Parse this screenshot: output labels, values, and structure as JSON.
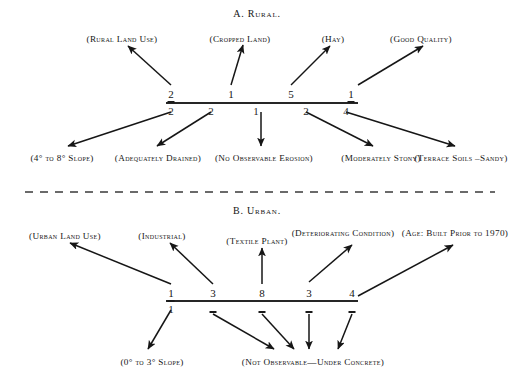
{
  "figure": {
    "sections": [
      {
        "id": "rural",
        "title": "A.  Rural.",
        "title_x": 257,
        "title_y": 8,
        "axis": {
          "x1": 166,
          "x2": 358,
          "y": 103
        },
        "codes_above": [
          {
            "value": "2",
            "x": 171,
            "y": 88,
            "underline": true
          },
          {
            "value": "1",
            "x": 231,
            "y": 88,
            "underline": false
          },
          {
            "value": "5",
            "x": 291,
            "y": 88,
            "underline": false
          },
          {
            "value": "1",
            "x": 351,
            "y": 88,
            "underline": true
          }
        ],
        "codes_below": [
          {
            "value": "2",
            "x": 171,
            "y": 105
          },
          {
            "value": "2",
            "x": 211,
            "y": 105
          },
          {
            "value": "1",
            "x": 256,
            "y": 105
          },
          {
            "value": "2",
            "x": 306,
            "y": 105
          },
          {
            "value": "4",
            "x": 346,
            "y": 105
          }
        ],
        "labels_above": [
          {
            "text": "(Rural Land Use)",
            "x": 122,
            "y": 34,
            "lines": 1
          },
          {
            "text": "(Cropped Land)",
            "x": 240,
            "y": 34,
            "lines": 1
          },
          {
            "text": "(Hay)",
            "x": 333,
            "y": 34,
            "lines": 1
          },
          {
            "text": "(Good Quality)",
            "x": 421,
            "y": 34,
            "lines": 1
          }
        ],
        "labels_below": [
          {
            "text": "(4° to 8° Slope)",
            "x": 62,
            "y": 153,
            "lines": 1
          },
          {
            "text": "(Adequately Drained)",
            "x": 158,
            "y": 153,
            "lines": 2
          },
          {
            "text": "(No Observable Erosion)",
            "x": 264,
            "y": 153,
            "lines": 1
          },
          {
            "text": "(Moderately Stony)",
            "x": 381,
            "y": 153,
            "lines": 2
          },
          {
            "text": "(Terrace Soils –Sandy)",
            "x": 461,
            "y": 153,
            "lines": 2
          }
        ],
        "arrows_up": [
          {
            "from_x": 171,
            "from_y": 85,
            "to_x": 128,
            "to_y": 46
          },
          {
            "from_x": 231,
            "from_y": 85,
            "to_x": 243,
            "to_y": 45
          },
          {
            "from_x": 291,
            "from_y": 85,
            "to_x": 330,
            "to_y": 46
          },
          {
            "from_x": 358,
            "from_y": 85,
            "to_x": 423,
            "to_y": 46
          }
        ],
        "arrows_down": [
          {
            "from_x": 171,
            "from_y": 112,
            "to_x": 68,
            "to_y": 146
          },
          {
            "from_x": 211,
            "from_y": 112,
            "to_x": 157,
            "to_y": 146
          },
          {
            "from_x": 261,
            "from_y": 112,
            "to_x": 261,
            "to_y": 146
          },
          {
            "from_x": 306,
            "from_y": 112,
            "to_x": 373,
            "to_y": 146
          },
          {
            "from_x": 346,
            "from_y": 112,
            "to_x": 455,
            "to_y": 146
          }
        ]
      },
      {
        "id": "urban",
        "title": "B.  Urban.",
        "title_x": 257,
        "title_y": 205,
        "axis": {
          "x1": 166,
          "x2": 358,
          "y": 301
        },
        "codes_above": [
          {
            "value": "1",
            "x": 171,
            "y": 287,
            "underline": true
          },
          {
            "value": "3",
            "x": 213,
            "y": 287,
            "underline": false
          },
          {
            "value": "8",
            "x": 262,
            "y": 287,
            "underline": false
          },
          {
            "value": "3",
            "x": 309,
            "y": 287,
            "underline": false
          },
          {
            "value": "4",
            "x": 352,
            "y": 287,
            "underline": false
          }
        ],
        "codes_below": [
          {
            "value": "1",
            "x": 171,
            "y": 303
          }
        ],
        "dashes_below": [
          {
            "x": 213,
            "y": 311
          },
          {
            "x": 262,
            "y": 311
          },
          {
            "x": 309,
            "y": 311
          },
          {
            "x": 352,
            "y": 311
          }
        ],
        "labels_above": [
          {
            "text": "(Urban Land Use)",
            "x": 65,
            "y": 231,
            "lines": 1
          },
          {
            "text": "(Industrial)",
            "x": 162,
            "y": 231,
            "lines": 1
          },
          {
            "text": "(Textile Plant)",
            "x": 257,
            "y": 236,
            "lines": 1
          },
          {
            "text": "(Deteriorating Condition)",
            "x": 343,
            "y": 228,
            "lines": 2
          },
          {
            "text": "(Age: Built Prior to 1970)",
            "x": 455,
            "y": 228,
            "lines": 2
          }
        ],
        "labels_below": [
          {
            "text": "(0° to 3° Slope)",
            "x": 152,
            "y": 357,
            "lines": 1
          },
          {
            "text": "(Not Observable—Under Concrete)",
            "x": 313,
            "y": 357,
            "lines": 1
          }
        ],
        "arrows_up": [
          {
            "from_x": 171,
            "from_y": 284,
            "to_x": 70,
            "to_y": 243
          },
          {
            "from_x": 213,
            "from_y": 284,
            "to_x": 170,
            "to_y": 243
          },
          {
            "from_x": 262,
            "from_y": 284,
            "to_x": 262,
            "to_y": 248
          },
          {
            "from_x": 309,
            "from_y": 282,
            "to_x": 352,
            "to_y": 245
          },
          {
            "from_x": 358,
            "from_y": 296,
            "to_x": 453,
            "to_y": 245
          }
        ],
        "arrows_down": [
          {
            "from_x": 171,
            "from_y": 310,
            "to_x": 148,
            "to_y": 349
          },
          {
            "from_x": 213,
            "from_y": 314,
            "to_x": 274,
            "to_y": 349
          },
          {
            "from_x": 262,
            "from_y": 314,
            "to_x": 294,
            "to_y": 349
          },
          {
            "from_x": 309,
            "from_y": 314,
            "to_x": 309,
            "to_y": 349
          },
          {
            "from_x": 352,
            "from_y": 314,
            "to_x": 338,
            "to_y": 349
          }
        ]
      }
    ],
    "divider": {
      "x1": 25,
      "x2": 495,
      "y": 192,
      "style": "dashed"
    }
  }
}
